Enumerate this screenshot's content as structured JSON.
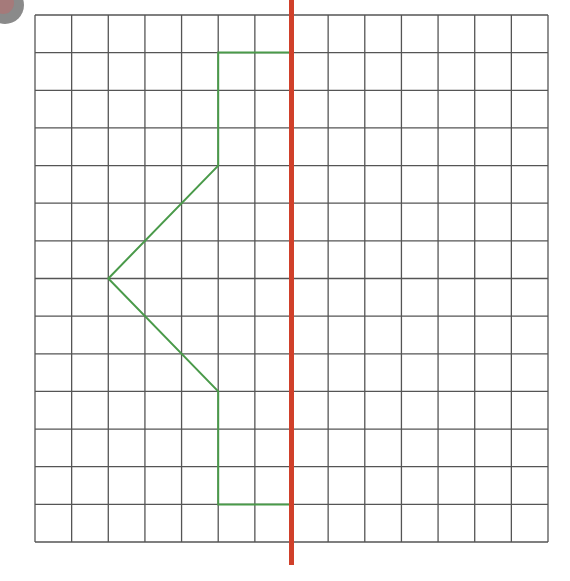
{
  "diagram": {
    "title": "",
    "grid": {
      "columns": 14,
      "rows": 14,
      "left": 35,
      "top": 15,
      "right": 548,
      "bottom": 542,
      "line_color": "#555555"
    },
    "mirror_line": {
      "grid_x": 7,
      "color": "#d0402a",
      "top": 0,
      "bottom": 565
    },
    "shape": {
      "color": "#4a9a4a",
      "points_grid": [
        [
          7,
          1
        ],
        [
          5,
          1
        ],
        [
          5,
          4
        ],
        [
          2,
          7
        ],
        [
          5,
          10
        ],
        [
          5,
          13
        ],
        [
          7,
          13
        ]
      ]
    },
    "corner_badge": {
      "visible": true
    }
  }
}
